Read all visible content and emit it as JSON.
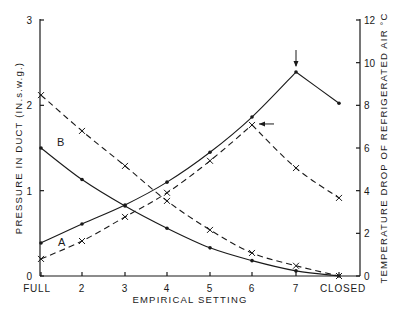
{
  "chart_data": {
    "type": "line",
    "title": "",
    "xlabel": "EMPIRICAL SETTING",
    "ylabel_left": "PRESSURE IN DUCT (IN.s.w.g.)",
    "ylabel_right": "TEMPERATURE DROP OF REFRIGERATED AIR °C",
    "categories": [
      "FULL",
      "2",
      "3",
      "4",
      "5",
      "6",
      "7",
      "CLOSED"
    ],
    "ylim_left": [
      0,
      3
    ],
    "yticks_left": [
      0,
      1,
      2,
      3
    ],
    "ylim_right": [
      0,
      12
    ],
    "yticks_right": [
      0,
      2,
      4,
      6,
      8,
      10,
      12
    ],
    "grid": false,
    "annotations": [
      {
        "text": "A",
        "near": "lower curves at x=FULL-2"
      },
      {
        "text": "B",
        "near": "upper curves at x=FULL-2"
      },
      {
        "type": "arrow-down",
        "at": "7",
        "series": "A temperature drop (peak)"
      },
      {
        "type": "arrow-left",
        "at": "6",
        "series": "B temperature drop (peak)"
      }
    ],
    "series": [
      {
        "name": "A pressure",
        "axis": "left",
        "style": "solid",
        "marker": "dot",
        "values": [
          1.5,
          1.13,
          0.82,
          0.56,
          0.33,
          0.18,
          0.06,
          0.0
        ]
      },
      {
        "name": "B pressure",
        "axis": "left",
        "style": "dashed",
        "marker": "cross",
        "values": [
          2.12,
          1.7,
          1.29,
          0.88,
          0.54,
          0.27,
          0.12,
          0.0
        ]
      },
      {
        "name": "A temperature drop",
        "axis": "right",
        "style": "solid",
        "marker": "dot",
        "values": [
          1.55,
          2.44,
          3.33,
          4.4,
          5.8,
          7.45,
          9.56,
          8.1
        ]
      },
      {
        "name": "B temperature drop",
        "axis": "right",
        "style": "dashed",
        "marker": "cross",
        "values": [
          0.8,
          1.64,
          2.77,
          3.9,
          5.4,
          7.08,
          5.06,
          3.66
        ]
      }
    ]
  },
  "labels": {
    "curve_a": "A",
    "curve_b": "B"
  }
}
